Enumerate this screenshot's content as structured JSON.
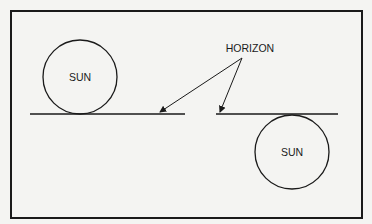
{
  "diagram": {
    "labels": {
      "sun_left": "SUN",
      "sun_right": "SUN",
      "horizon": "HORIZON"
    },
    "colors": {
      "background": "#f4f4f2",
      "stroke": "#1a1a1a"
    }
  }
}
